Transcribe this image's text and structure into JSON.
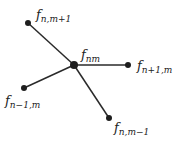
{
  "diagram": {
    "type": "stencil-graph",
    "nodes": [
      {
        "id": "center",
        "label_main": "f",
        "label_sub": "nm",
        "x": 74,
        "y": 65,
        "lx": 81,
        "ly": 59
      },
      {
        "id": "up",
        "label_main": "f",
        "label_sub": "n,m+1",
        "x": 28,
        "y": 23,
        "lx": 36,
        "ly": 19
      },
      {
        "id": "right",
        "label_main": "f",
        "label_sub": "n+1,m",
        "x": 128,
        "y": 65,
        "lx": 137,
        "ly": 70
      },
      {
        "id": "left",
        "label_main": "f",
        "label_sub": "n−1,m",
        "x": 24,
        "y": 88,
        "lx": 5,
        "ly": 105
      },
      {
        "id": "down",
        "label_main": "f",
        "label_sub": "n,m−1",
        "x": 109,
        "y": 118,
        "lx": 114,
        "ly": 132
      }
    ],
    "edges": [
      {
        "from": "center",
        "to": "up"
      },
      {
        "from": "center",
        "to": "right"
      },
      {
        "from": "center",
        "to": "left"
      },
      {
        "from": "center",
        "to": "down"
      }
    ],
    "colors": {
      "edge": "#2a2a2a",
      "node": "#1e1e1e",
      "text": "#222222",
      "background": "#ffffff"
    }
  }
}
